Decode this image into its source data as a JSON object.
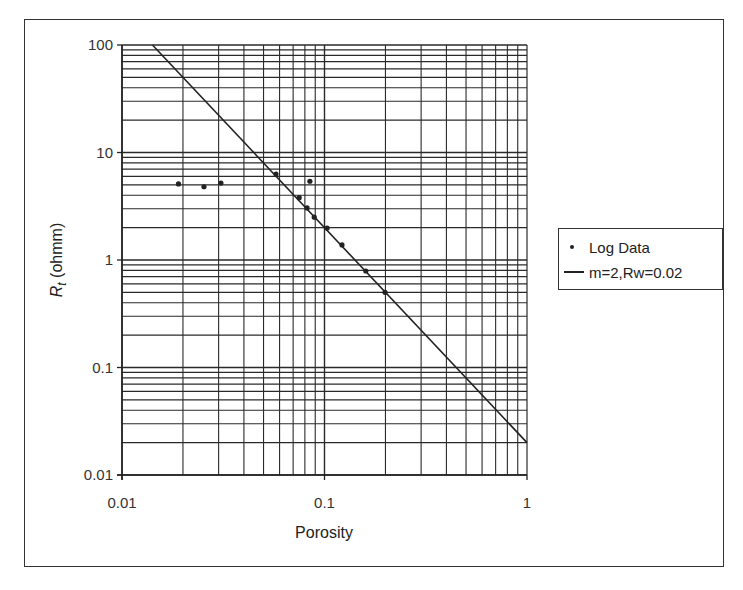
{
  "chart_data": {
    "type": "scatter",
    "title": "",
    "xlabel": "Porosity",
    "ylabel": "Rt (ohmm)",
    "ylabel_main": "R",
    "ylabel_sub": "t",
    "ylabel_unit": " (ohmm)",
    "xscale": "log",
    "yscale": "log",
    "xlim": [
      0.01,
      1
    ],
    "ylim": [
      0.01,
      100
    ],
    "x_ticks": [
      "0.01",
      "0.1",
      "1"
    ],
    "y_ticks": [
      "100",
      "10",
      "1",
      "0.1",
      "0.01"
    ],
    "grid": true,
    "legend_position": "right",
    "series": [
      {
        "name": "Log Data",
        "kind": "scatter",
        "x": [
          0.019,
          0.0254,
          0.0308,
          0.0576,
          0.0847,
          0.075,
          0.082,
          0.089,
          0.103,
          0.122,
          0.16,
          0.199
        ],
        "y": [
          5.1,
          4.8,
          5.2,
          6.3,
          5.4,
          3.8,
          3.05,
          2.5,
          1.98,
          1.38,
          0.79,
          0.5
        ]
      },
      {
        "name": "m=2,Rw=0.02",
        "kind": "line",
        "equation": "Rt = 0.02 / porosity^2",
        "x": [
          0.01414,
          1
        ],
        "y": [
          100,
          0.02
        ]
      }
    ]
  },
  "legend": {
    "items": [
      {
        "label": "Log Data",
        "marker": "dot"
      },
      {
        "label": "m=2,Rw=0.02",
        "marker": "line"
      }
    ]
  },
  "colors": {
    "ink": "#222222",
    "grid": "#2a2a2a",
    "background": "#ffffff"
  }
}
